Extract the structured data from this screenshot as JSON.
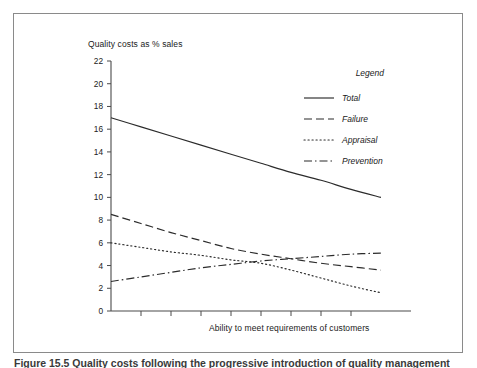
{
  "figure": {
    "caption": "Figure 15.5  Quality costs following the progressive introduction of quality management",
    "border_color": "#8a8a8a"
  },
  "chart_data": {
    "type": "line",
    "title": "",
    "ylabel": "Quality costs as % sales",
    "xlabel": "Ability to meet requirements of customers",
    "ylim": [
      0,
      22
    ],
    "xlim": [
      0,
      10
    ],
    "yticks": [
      0,
      2,
      4,
      6,
      8,
      10,
      12,
      14,
      16,
      18,
      20,
      22
    ],
    "ytick_labels": [
      "0",
      "2",
      "4",
      "6",
      "8",
      "10",
      "12",
      "14",
      "16",
      "18",
      "20",
      "22"
    ],
    "xticks": [
      1,
      2,
      3,
      4,
      5,
      6,
      7,
      8
    ],
    "xtick_labels": [],
    "grid": false,
    "legend_position": "upper-right",
    "legend_title": "Legend",
    "x": [
      0,
      1,
      2,
      3,
      4,
      5,
      6,
      7,
      8,
      9
    ],
    "series": [
      {
        "name": "Total",
        "style": "solid",
        "color": "#2b2b2b",
        "values": [
          17.0,
          16.2,
          15.4,
          14.6,
          13.8,
          13.0,
          12.2,
          11.5,
          10.7,
          10.0
        ]
      },
      {
        "name": "Failure",
        "style": "dashed",
        "color": "#2b2b2b",
        "values": [
          8.5,
          7.7,
          6.9,
          6.2,
          5.5,
          5.0,
          4.6,
          4.2,
          3.9,
          3.6
        ]
      },
      {
        "name": "Appraisal",
        "style": "dotted",
        "color": "#2b2b2b",
        "values": [
          6.0,
          5.6,
          5.2,
          4.9,
          4.5,
          4.2,
          3.6,
          2.9,
          2.2,
          1.6
        ]
      },
      {
        "name": "Prevention",
        "style": "dashdot",
        "color": "#2b2b2b",
        "values": [
          2.6,
          3.0,
          3.4,
          3.8,
          4.1,
          4.4,
          4.6,
          4.8,
          5.0,
          5.1
        ]
      }
    ]
  },
  "legend": {
    "title": "Legend",
    "entries": [
      {
        "label": "Total",
        "style": "solid"
      },
      {
        "label": "Failure",
        "style": "dashed"
      },
      {
        "label": "Appraisal",
        "style": "dotted"
      },
      {
        "label": "Prevention",
        "style": "dashdot"
      }
    ]
  }
}
